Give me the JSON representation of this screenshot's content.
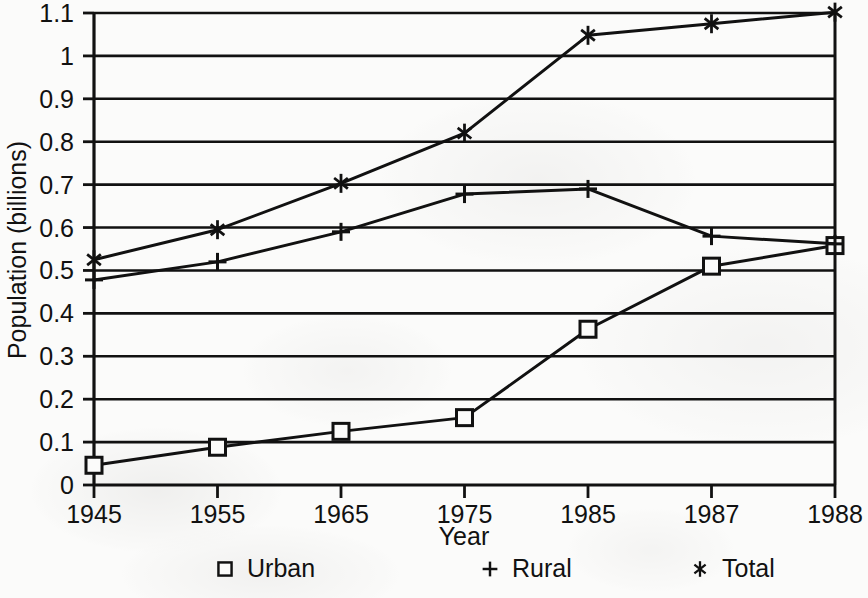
{
  "chart_data": {
    "type": "line",
    "title": "",
    "xlabel": "Year",
    "ylabel": "Population (billions)",
    "categories": [
      "1945",
      "1955",
      "1965",
      "1975",
      "1985",
      "1987",
      "1988"
    ],
    "ylim": [
      0,
      1.1
    ],
    "ytick_labels": [
      "0",
      "0.1",
      "0.2",
      "0.3",
      "0.4",
      "0.5",
      "0.6",
      "0.7",
      "0.8",
      "0.9",
      "1",
      "1.1"
    ],
    "ytick_values": [
      0,
      0.1,
      0.2,
      0.3,
      0.4,
      0.5,
      0.6,
      0.7,
      0.8,
      0.9,
      1.0,
      1.1
    ],
    "grid": "horizontal",
    "legend_position": "bottom",
    "series": [
      {
        "name": "Urban",
        "marker": "square",
        "values": [
          0.046,
          0.088,
          0.125,
          0.157,
          0.363,
          0.51,
          0.558
        ]
      },
      {
        "name": "Rural",
        "marker": "plus",
        "values": [
          0.478,
          0.52,
          0.59,
          0.678,
          0.69,
          0.58,
          0.562
        ]
      },
      {
        "name": "Total",
        "marker": "asterisk",
        "values": [
          0.525,
          0.595,
          0.703,
          0.82,
          1.048,
          1.075,
          1.102
        ]
      }
    ]
  },
  "legend": {
    "items": [
      {
        "label": "Urban",
        "marker": "square"
      },
      {
        "label": "Rural",
        "marker": "plus"
      },
      {
        "label": "Total",
        "marker": "asterisk"
      }
    ]
  },
  "colors": {
    "ink": "#111111",
    "background": "#fbfbfa"
  }
}
